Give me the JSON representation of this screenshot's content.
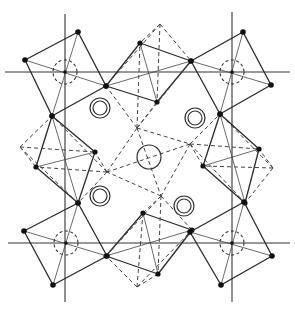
{
  "diagram": {
    "type": "crystal-structure-octahedral-framework",
    "colors": {
      "line": "#2a2a2a",
      "background": "#ffffff"
    },
    "axes": {
      "horizontal": [
        {
          "y": 72,
          "x1": 5,
          "x2": 290
        },
        {
          "y": 243,
          "x1": 8,
          "x2": 290
        }
      ],
      "vertical": [
        {
          "x": 65,
          "y1": 14,
          "y2": 302
        },
        {
          "x": 232,
          "y1": 12,
          "y2": 302
        }
      ]
    },
    "corner_octahedra": [
      {
        "name": "top-left",
        "center": [
          65,
          72
        ],
        "vertices": [
          [
            25,
            60
          ],
          [
            78,
            32
          ],
          [
            106,
            86
          ],
          [
            52,
            116
          ]
        ]
      },
      {
        "name": "top-right",
        "center": [
          232,
          72
        ],
        "vertices": [
          [
            191,
            61
          ],
          [
            243,
            32
          ],
          [
            271,
            85
          ],
          [
            220,
            114
          ]
        ]
      },
      {
        "name": "bottom-left",
        "center": [
          66,
          243
        ],
        "vertices": [
          [
            24,
            231
          ],
          [
            78,
            203
          ],
          [
            107,
            256
          ],
          [
            53,
            285
          ]
        ]
      },
      {
        "name": "bottom-right",
        "center": [
          232,
          243
        ],
        "vertices": [
          [
            190,
            232
          ],
          [
            244,
            202
          ],
          [
            272,
            256
          ],
          [
            221,
            285
          ]
        ]
      }
    ],
    "edge_octahedra": [
      {
        "name": "top-center",
        "solid": [
          [
            140,
            43
          ],
          [
            191,
            61
          ],
          [
            157,
            102
          ],
          [
            106,
            86
          ]
        ],
        "apex_top": [
          160,
          24
        ],
        "apex_bottom": [
          137,
          128
        ]
      },
      {
        "name": "left-center",
        "solid": [
          [
            52,
            116
          ],
          [
            95,
            152
          ],
          [
            78,
            203
          ],
          [
            36,
            167
          ]
        ],
        "apex_left": [
          20,
          147
        ],
        "apex_right": [
          107,
          172
        ]
      },
      {
        "name": "right-center",
        "solid": [
          [
            220,
            114
          ],
          [
            259,
            149
          ],
          [
            245,
            203
          ],
          [
            203,
            166
          ]
        ],
        "apex_left": [
          190,
          144
        ],
        "apex_right": [
          273,
          168
        ]
      },
      {
        "name": "bottom-center",
        "solid": [
          [
            106,
            256
          ],
          [
            143,
            213
          ],
          [
            192,
            230
          ],
          [
            158,
            274
          ]
        ],
        "apex_top": [
          161,
          196
        ],
        "apex_bottom": [
          137,
          287
        ]
      }
    ],
    "central_dashed_octahedron": {
      "vertices": [
        [
          137,
          128
        ],
        [
          190,
          144
        ],
        [
          161,
          196
        ],
        [
          107,
          172
        ]
      ]
    },
    "double_circles": [
      [
        100,
        108
      ],
      [
        195,
        118
      ],
      [
        100,
        196
      ],
      [
        184,
        206
      ]
    ],
    "double_circle_radii": [
      10,
      7
    ],
    "center_circle": {
      "cx": 149,
      "cy": 157,
      "r": 12
    },
    "dashed_corner_circles_radius": 12
  }
}
